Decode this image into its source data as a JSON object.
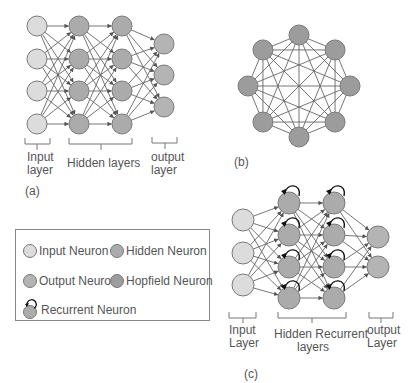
{
  "colors": {
    "input": "#dcdcdc",
    "hidden": "#ababab",
    "output": "#b4b4b4",
    "hopfield": "#9c9c9c",
    "stroke": "#7a7a7a",
    "edge": "#666666"
  },
  "panel_a": {
    "label": "(a)",
    "layers": [
      {
        "name": "input",
        "x": 37,
        "ys": [
          26,
          59,
          91,
          124
        ],
        "type": "input"
      },
      {
        "name": "hidden1",
        "x": 79,
        "ys": [
          26,
          59,
          91,
          124
        ],
        "type": "hidden"
      },
      {
        "name": "hidden2",
        "x": 122,
        "ys": [
          26,
          59,
          91,
          124
        ],
        "type": "hidden"
      },
      {
        "name": "output",
        "x": 164,
        "ys": [
          44,
          75,
          107
        ],
        "type": "output"
      }
    ],
    "radius": 10,
    "labels": {
      "input_line1": "Input",
      "input_line2": "layer",
      "hidden": "Hidden layers",
      "output_line1": "output",
      "output_line2": "layer"
    }
  },
  "panel_b": {
    "label": "(b)",
    "center": [
      299,
      86
    ],
    "ring_radius": 51,
    "node_count": 8,
    "radius": 10,
    "type": "hopfield"
  },
  "panel_c": {
    "label": "(c)",
    "layers": [
      {
        "name": "input",
        "x": 243,
        "ys": [
          220,
          253,
          285
        ],
        "type": "input"
      },
      {
        "name": "hidden1",
        "x": 289,
        "ys": [
          203,
          235,
          267,
          298
        ],
        "type": "hidden",
        "recurrent": true
      },
      {
        "name": "hidden2",
        "x": 334,
        "ys": [
          203,
          235,
          267,
          298
        ],
        "type": "hidden",
        "recurrent": true
      },
      {
        "name": "output",
        "x": 378,
        "ys": [
          237,
          267
        ],
        "type": "output"
      }
    ],
    "radius": 11,
    "labels": {
      "input_line1": "Input",
      "input_line2": "Layer",
      "hidden_line1": "Hidden Recurrent",
      "hidden_line2": "layers",
      "output_line1": "output",
      "output_line2": "Layer"
    }
  },
  "legend": {
    "items": [
      {
        "label": "Input Neuron",
        "type": "input"
      },
      {
        "label": "Hidden Neuron",
        "type": "hidden"
      },
      {
        "label": "Output Neuron",
        "type": "output"
      },
      {
        "label": "Hopfield Neuron",
        "type": "hopfield"
      },
      {
        "label": "Recurrent Neuron",
        "type": "hidden"
      }
    ]
  }
}
